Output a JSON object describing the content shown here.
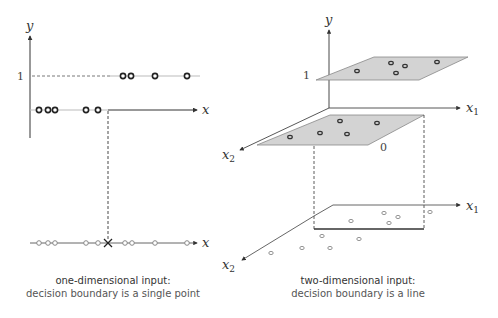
{
  "left_panel": {
    "axis_labels": {
      "y": "y",
      "x_upper": "x",
      "x_lower": "x",
      "y_tick_1": "1"
    },
    "points_y1_x": [
      123,
      131,
      155,
      187
    ],
    "points_y0_x": [
      39,
      48,
      55,
      86,
      98
    ],
    "boundary_x": 108,
    "points_projected_x": [
      39,
      48,
      55,
      86,
      98,
      125,
      132,
      155,
      187
    ],
    "caption_title": "one-dimensional input:",
    "caption_subtitle": "decision boundary is a single point"
  },
  "right_panel": {
    "axis_labels": {
      "y": "y",
      "x1_upper": "x",
      "x1_upper_sub": "1",
      "x2_upper": "x",
      "x2_upper_sub": "2",
      "x1_lower": "x",
      "x1_lower_sub": "1",
      "x2_lower": "x",
      "x2_lower_sub": "2",
      "y_tick_1": "1",
      "y_tick_0": "0"
    },
    "top_plane_points": [
      [
        357,
        71
      ],
      [
        391,
        63
      ],
      [
        405,
        66
      ],
      [
        396,
        73
      ],
      [
        437,
        62
      ]
    ],
    "bottom_plane_points": [
      [
        290,
        137
      ],
      [
        320,
        133
      ],
      [
        340,
        121
      ],
      [
        347,
        134
      ],
      [
        377,
        123
      ]
    ],
    "floor_points": [
      [
        384,
        213
      ],
      [
        398,
        212
      ],
      [
        351,
        221
      ],
      [
        403,
        216
      ],
      [
        430,
        212
      ],
      [
        322,
        236
      ],
      [
        359,
        239
      ],
      [
        272,
        252
      ],
      [
        302,
        248
      ],
      [
        330,
        248
      ]
    ],
    "caption_title": "two-dimensional input:",
    "caption_subtitle": "decision boundary is a line"
  },
  "colors": {
    "plane_fill": "#d3d3d3",
    "plane_stroke": "#999999",
    "axis": "#333333",
    "gray_line": "#999999",
    "point_stroke_dark": "#222222",
    "point_stroke_light": "#888888"
  }
}
